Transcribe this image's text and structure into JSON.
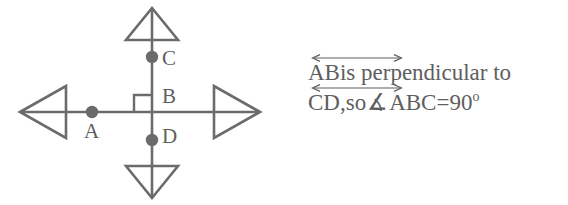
{
  "figure": {
    "type": "geometry-diagram",
    "stroke_color": "#6b6b6b",
    "label_color": "#5f5f5f",
    "points": [
      {
        "id": "A",
        "label": "A",
        "on_line": "horizontal",
        "x": 92,
        "y": 112,
        "dot": true
      },
      {
        "id": "C",
        "label": "C",
        "on_line": "vertical",
        "x": 152,
        "y": 56,
        "dot": true
      },
      {
        "id": "B",
        "label": "B",
        "on_line": "intersection",
        "x": 152,
        "y": 112,
        "dot": false
      },
      {
        "id": "D",
        "label": "D",
        "on_line": "vertical",
        "x": 152,
        "y": 140,
        "dot": true
      }
    ],
    "lines": [
      {
        "id": "horizontal-line",
        "name": "AB",
        "from_x": 22,
        "to_x": 258,
        "y": 112,
        "arrowheads": "both",
        "arrowhead_style": "hollow-triangle"
      },
      {
        "id": "vertical-line",
        "name": "CD",
        "x": 152,
        "from_y": 10,
        "to_y": 196,
        "arrowheads": "both",
        "arrowhead_style": "hollow-triangle"
      }
    ],
    "right_angle_marker": {
      "quadrant": "upper-left",
      "size": 17,
      "at_x": 152,
      "at_y": 112
    }
  },
  "statement": {
    "line1": {
      "overarrow_segment": "AB",
      "rest": " is perpendicular to"
    },
    "line2": {
      "overarrow_segment": "CD",
      "comma": ",",
      "so": " so ",
      "angle_symbol": "∡",
      "angle_name": "ABC",
      "equals": " = ",
      "value": "90",
      "degree": "o"
    }
  },
  "colors": {
    "stroke": "#6b6b6b",
    "text": "#5e5e5e",
    "background": "#ffffff"
  }
}
